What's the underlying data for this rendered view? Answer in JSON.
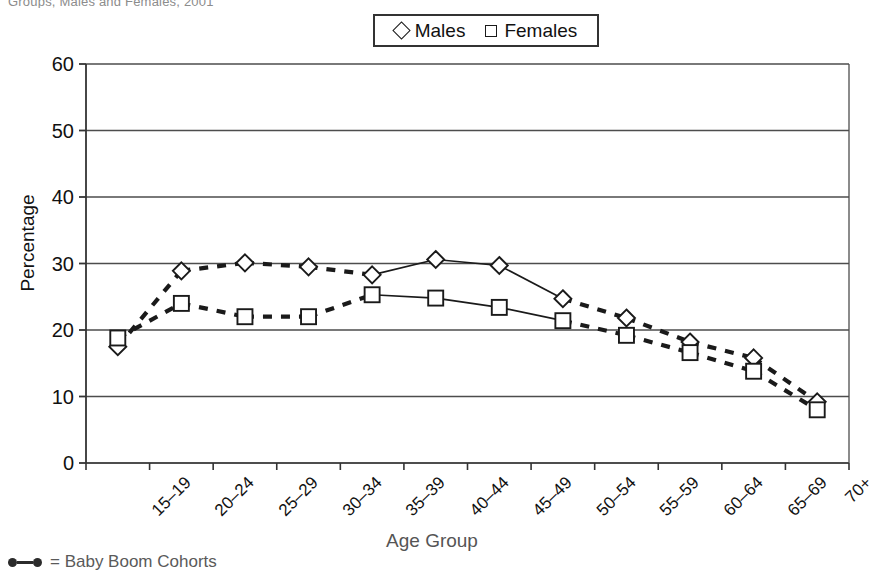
{
  "page": {
    "cut_title": "Groups, Males and Females, 2001"
  },
  "legend": {
    "position": "top-center",
    "items": [
      {
        "label": "Males",
        "marker": "diamond-marker"
      },
      {
        "label": "Females",
        "marker": "square-marker"
      }
    ]
  },
  "footnote": {
    "text": "= Baby Boom Cohorts",
    "glyph": "solid-line-with-dots"
  },
  "axis": {
    "y_title": "Percentage",
    "x_title": "Age Group",
    "y_ticks": [
      "0",
      "10",
      "20",
      "30",
      "40",
      "50",
      "60"
    ]
  },
  "chart_data": {
    "type": "line",
    "title": "",
    "xlabel": "Age Group",
    "ylabel": "Percentage",
    "ylim": [
      0,
      60
    ],
    "ytick_step": 10,
    "grid": true,
    "legend_position": "top-center",
    "categories": [
      "15–19",
      "20–24",
      "25–29",
      "30–34",
      "35–39",
      "40–44",
      "45–49",
      "50–54",
      "55–59",
      "60–64",
      "65–69",
      "70+"
    ],
    "series": [
      {
        "name": "Males",
        "marker": "diamond",
        "values": [
          17.5,
          28.9,
          30.1,
          29.5,
          28.3,
          30.6,
          29.7,
          24.7,
          21.8,
          18.2,
          15.8,
          9.2
        ],
        "solid_segment_indices": [
          4,
          5,
          6,
          7
        ]
      },
      {
        "name": "Females",
        "marker": "square",
        "values": [
          18.8,
          24.0,
          22.0,
          22.0,
          25.3,
          24.8,
          23.4,
          21.4,
          19.2,
          16.6,
          13.8,
          8.0
        ],
        "solid_segment_indices": [
          4,
          5,
          6,
          7
        ]
      }
    ]
  },
  "colors": {
    "line": "#1a1a1a",
    "grid": "#4d4d4d",
    "marker_fill": "#ffffff",
    "text": "#111111"
  }
}
